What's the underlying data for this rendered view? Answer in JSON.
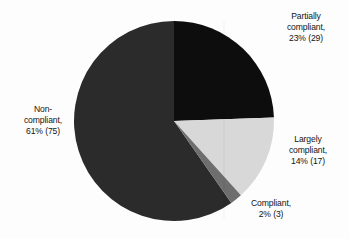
{
  "background_color": "#fdfdfd",
  "chart_data": {
    "type": "pie",
    "title": "",
    "subtitle": "",
    "xlabel": "",
    "ylabel": "",
    "legend_position": "none",
    "grid": false,
    "total_count": 124,
    "center": {
      "x": 174,
      "y": 121
    },
    "radius": 100,
    "start_angle_deg": 0,
    "direction": "clockwise",
    "categories": [
      "Partially compliant",
      "Largely compliant",
      "Compliant",
      "Non-compliant"
    ],
    "values": [
      23,
      14,
      2,
      61
    ],
    "counts": [
      29,
      17,
      3,
      75
    ],
    "colors": [
      "#0d0d0d",
      "#d8d8d8",
      "#6e6e6e",
      "#2b2b2b"
    ],
    "slices": [
      {
        "name": "partially-compliant",
        "percent": 23,
        "count": 29,
        "color": "#0d0d0d",
        "start_deg": 0,
        "end_deg": 88,
        "label_lines": [
          "Partially",
          "compliant,",
          "23% (29)"
        ]
      },
      {
        "name": "largely-compliant",
        "percent": 14,
        "count": 17,
        "color": "#d8d8d8",
        "start_deg": 88,
        "end_deg": 138,
        "label_lines": [
          "Largely",
          "compliant,",
          "14% (17)"
        ]
      },
      {
        "name": "compliant",
        "percent": 2,
        "count": 3,
        "color": "#6e6e6e",
        "start_deg": 138,
        "end_deg": 145,
        "label_lines": [
          "Compliant,",
          "2% (3)"
        ]
      },
      {
        "name": "non-compliant",
        "percent": 61,
        "count": 75,
        "color": "#2b2b2b",
        "start_deg": 145,
        "end_deg": 360,
        "label_lines": [
          "Non-",
          "compliant,",
          "61% (75)"
        ]
      }
    ]
  },
  "labels": {
    "partially": {
      "line1": "Partially",
      "line2": "compliant,",
      "line3": "23% (29)"
    },
    "largely": {
      "line1": "Largely",
      "line2": "compliant,",
      "line3": "14% (17)"
    },
    "compliant": {
      "line1": "Compliant,",
      "line2": "2% (3)"
    },
    "non": {
      "line1": "Non-",
      "line2": "compliant,",
      "line3": "61% (75)"
    }
  }
}
